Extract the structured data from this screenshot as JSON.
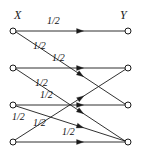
{
  "figure": {
    "width": 141,
    "height": 161,
    "background": "#ffffff",
    "stroke_color": "#1a1a1a",
    "node_fill": "#ffffff"
  },
  "axis_labels": {
    "left_set": "X",
    "right_set": "Y"
  },
  "nodes": {
    "left": [
      {
        "id": "x1",
        "cx": 13,
        "cy": 31,
        "r": 3
      },
      {
        "id": "x2",
        "cx": 13,
        "cy": 68,
        "r": 3
      },
      {
        "id": "x3",
        "cx": 13,
        "cy": 105,
        "r": 3
      },
      {
        "id": "x4",
        "cx": 13,
        "cy": 142,
        "r": 3
      }
    ],
    "right": [
      {
        "id": "y1",
        "cx": 128,
        "cy": 31,
        "r": 3
      },
      {
        "id": "y2",
        "cx": 128,
        "cy": 68,
        "r": 3
      },
      {
        "id": "y3",
        "cx": 128,
        "cy": 105,
        "r": 3
      },
      {
        "id": "y4",
        "cx": 128,
        "cy": 142,
        "r": 3
      }
    ]
  },
  "edges": [
    {
      "id": "e1",
      "from": "x1",
      "to": "y1",
      "weight": "1/2",
      "x1": 16,
      "y1": 31,
      "x2": 125,
      "y2": 31,
      "arrow_t": 0.62,
      "label_x": 47,
      "label_y": 16
    },
    {
      "id": "e2",
      "from": "x1",
      "to": "y3",
      "weight": "1/2",
      "x1": 16,
      "y1": 32,
      "x2": 125,
      "y2": 104,
      "arrow_t": 0.62,
      "label_x": 33,
      "label_y": 41
    },
    {
      "id": "e3",
      "from": "x2",
      "to": "y2",
      "weight": "1/2",
      "x1": 16,
      "y1": 68,
      "x2": 125,
      "y2": 68,
      "arrow_t": 0.62,
      "label_x": 52,
      "label_y": 53
    },
    {
      "id": "e4",
      "from": "x2",
      "to": "y4",
      "weight": "1/2",
      "x1": 16,
      "y1": 69,
      "x2": 125,
      "y2": 141,
      "arrow_t": 0.62,
      "label_x": 35,
      "label_y": 78
    },
    {
      "id": "e5",
      "from": "x3",
      "to": "y3",
      "weight": "1/2",
      "x1": 16,
      "y1": 105,
      "x2": 125,
      "y2": 105,
      "arrow_t": 0.62,
      "label_x": 40,
      "label_y": 90
    },
    {
      "id": "e6",
      "from": "x4",
      "to": "y2",
      "weight": "1/2",
      "x1": 15,
      "y1": 140,
      "x2": 126,
      "y2": 69,
      "arrow_t": 0.62,
      "label_x": 12,
      "label_y": 112
    },
    {
      "id": "e7",
      "from": "x4",
      "to": "y4",
      "weight": "1/2",
      "x1": 16,
      "y1": 142,
      "x2": 125,
      "y2": 142,
      "arrow_t": 0.62,
      "label_x": 62,
      "label_y": 127
    },
    {
      "id": "e8",
      "from": "x3",
      "to": "y4",
      "weight": "1/2",
      "x1": 16,
      "y1": 106,
      "x2": 125,
      "y2": 141,
      "arrow_t": 0.62,
      "label_x": 33,
      "label_y": 118
    }
  ]
}
